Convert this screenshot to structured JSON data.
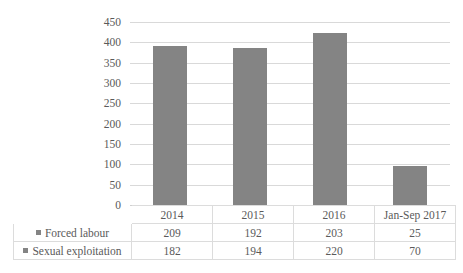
{
  "chart_data": {
    "type": "bar",
    "subtype": "stacked-column",
    "title": "",
    "xlabel": "",
    "ylabel": "",
    "categories": [
      "2014",
      "2015",
      "2016",
      "Jan-Sep 2017"
    ],
    "series": [
      {
        "name": "Forced labour",
        "values": [
          209,
          192,
          203,
          25
        ],
        "color": "#848484"
      },
      {
        "name": "Sexual exploitation",
        "values": [
          182,
          194,
          220,
          70
        ],
        "color": "#848484"
      }
    ],
    "totals": [
      391,
      386,
      423,
      95
    ],
    "ylim": [
      0,
      450
    ],
    "ytick_step": 50,
    "yticks": [
      "450",
      "400",
      "350",
      "300",
      "250",
      "200",
      "150",
      "100",
      "50",
      "0"
    ],
    "grid": true,
    "legend_position": "data-table-left",
    "data_table_visible": true
  },
  "axis": {
    "ticks": [
      "450",
      "400",
      "350",
      "300",
      "250",
      "200",
      "150",
      "100",
      "50",
      "0"
    ]
  },
  "table": {
    "category_headers": [
      "2014",
      "2015",
      "2016",
      "Jan-Sep 2017"
    ],
    "rows": [
      {
        "label": "Forced labour",
        "values": [
          "209",
          "192",
          "203",
          "25"
        ]
      },
      {
        "label": "Sexual exploitation",
        "values": [
          "182",
          "194",
          "220",
          "70"
        ]
      }
    ]
  },
  "colors": {
    "bar": "#848484",
    "gridline": "#d9d9d9",
    "table_border": "#dcdcdc",
    "text": "#5a5a5a",
    "background": "#ffffff"
  }
}
